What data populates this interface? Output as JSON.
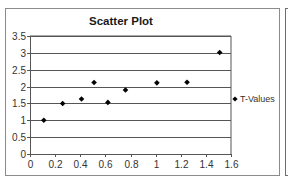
{
  "chart_data": {
    "type": "scatter",
    "title": "Scatter Plot",
    "xlabel": "",
    "ylabel": "",
    "xlim": [
      0,
      1.6
    ],
    "ylim": [
      0,
      3.5
    ],
    "x_ticks": [
      "0",
      "0.2",
      "0.4",
      "0.6",
      "0.8",
      "1",
      "1.2",
      "1.4",
      "1.6"
    ],
    "y_ticks": [
      "0",
      "0.5",
      "1",
      "1.5",
      "2",
      "2.5",
      "3",
      "3.5"
    ],
    "grid": {
      "horizontal": true,
      "vertical": false
    },
    "legend_position": "right",
    "series": [
      {
        "name": "T-Values",
        "marker": "diamond",
        "color": "#000000",
        "x": [
          0.11,
          0.26,
          0.41,
          0.51,
          0.62,
          0.76,
          1.01,
          1.25,
          1.51
        ],
        "y": [
          1.0,
          1.5,
          1.63,
          2.12,
          1.53,
          1.9,
          2.11,
          2.13,
          3.01
        ]
      }
    ]
  },
  "colors": {
    "gridline": "#555555",
    "axis": "#555555",
    "frame": "#8c8c8c",
    "marker": "#000000"
  }
}
